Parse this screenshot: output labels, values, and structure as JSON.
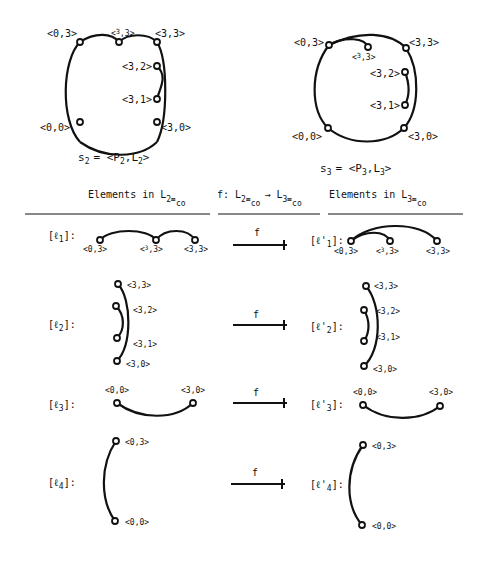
{
  "structures": [
    {
      "id": "s2",
      "caption": "s2 = <P2,L2>",
      "caption_parts": {
        "s": "s",
        "sub": "2",
        "eq": "= <P",
        "p_sub": "2",
        "comma": ",L",
        "l_sub": "2",
        "close": ">"
      },
      "points": [
        "<0,3>",
        "<3/2,3>",
        "<3,3>",
        "<3,2>",
        "<3,1>",
        "<0,0>",
        "<3,0>"
      ]
    },
    {
      "id": "s3",
      "caption": "s3 = <P3,L3>",
      "caption_parts": {
        "s": "s",
        "sub": "3",
        "eq": "= <P",
        "p_sub": "3",
        "comma": ",L",
        "l_sub": "3",
        "close": ">"
      },
      "points": [
        "<0,3>",
        "<3/2,3>",
        "<3,3>",
        "<3,2>",
        "<3,1>",
        "<0,0>",
        "<3,0>"
      ]
    }
  ],
  "labels": {
    "p03": "<0,3>",
    "p33": "<3,3>",
    "p32": "<3,2>",
    "p31": "<3,1>",
    "p00": "<0,0>",
    "p30": "<3,0>",
    "half_open": "<",
    "half_num": "3",
    "half_den": "2",
    "half_close": ",3>"
  },
  "table": {
    "header_left": "Elements in  L",
    "header_left_sub": "2≡",
    "header_left_subsub": "co",
    "header_mid": "f: L",
    "header_mid_sub1": "2≡",
    "header_mid_co1": "co",
    "header_mid_arrow": "→ L",
    "header_mid_sub2": "3≡",
    "header_mid_co2": "co",
    "header_right": "Elements in L",
    "header_right_sub": "3≡",
    "header_right_subsub": "co",
    "rows": [
      {
        "left_label": "[ℓ",
        "left_sub": "1",
        "right_label": "[ℓ'",
        "right_sub": "1",
        "map": "f"
      },
      {
        "left_label": "[ℓ",
        "left_sub": "2",
        "right_label": "[ℓ'",
        "right_sub": "2",
        "map": "f"
      },
      {
        "left_label": "[ℓ",
        "left_sub": "3",
        "right_label": "[ℓ'",
        "right_sub": "3",
        "map": "f"
      },
      {
        "left_label": "[ℓ",
        "left_sub": "4",
        "right_label": "[ℓ'",
        "right_sub": "4",
        "map": "f"
      }
    ],
    "label_suffix": "]:"
  }
}
